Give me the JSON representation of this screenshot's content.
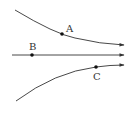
{
  "diagram": {
    "type": "field-lines",
    "lines": [
      {
        "name": "upper-line",
        "direction": "right",
        "shape": "curve"
      },
      {
        "name": "middle-line",
        "direction": "right",
        "shape": "straight"
      },
      {
        "name": "lower-line",
        "direction": "right",
        "shape": "curve"
      }
    ],
    "points": [
      {
        "label": "A",
        "on": "upper-line"
      },
      {
        "label": "B",
        "on": "middle-line"
      },
      {
        "label": "C",
        "on": "lower-line"
      }
    ],
    "colors": {
      "line": "#333333",
      "point": "#111111",
      "background": "#ffffff"
    }
  }
}
